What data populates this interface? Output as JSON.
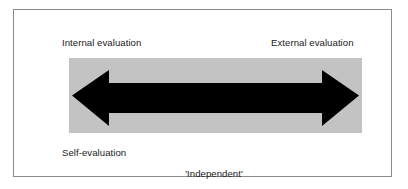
{
  "figure": {
    "type": "continuum-diagram",
    "frame": {
      "border_color": "#8b8b8b",
      "background_color": "#ffffff"
    },
    "band": {
      "name": "continuum-band",
      "fill_color": "#c3c3c3"
    },
    "arrow": {
      "name": "double-headed-arrow",
      "fill_color": "#000000",
      "direction": "bidirectional"
    },
    "labels": {
      "top_left": "Internal evaluation",
      "top_right": "External evaluation",
      "bottom_left": "Self-evaluation",
      "bottom_centre_line1": "'Independent'",
      "bottom_centre_line2": "internal evaluation"
    }
  }
}
